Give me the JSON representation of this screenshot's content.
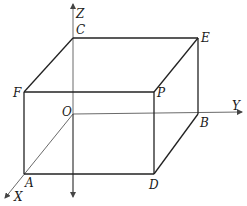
{
  "diagram": {
    "type": "3d-rectangular-box-with-axes",
    "axes": {
      "z_label": "Z",
      "y_label": "Y",
      "x_label": "X",
      "origin_label": "O"
    },
    "vertices": {
      "C": "C",
      "E": "E",
      "F": "F",
      "P": "P",
      "O": "O",
      "B": "B",
      "A": "A",
      "D": "D"
    },
    "edges": [
      [
        "C",
        "E"
      ],
      [
        "C",
        "F"
      ],
      [
        "E",
        "P"
      ],
      [
        "F",
        "P"
      ],
      [
        "E",
        "B"
      ],
      [
        "F",
        "A"
      ],
      [
        "P",
        "D"
      ],
      [
        "A",
        "D"
      ],
      [
        "B",
        "D"
      ]
    ],
    "hidden_axis_edges": [
      [
        "O",
        "C"
      ],
      [
        "O",
        "B"
      ],
      [
        "O",
        "A"
      ]
    ],
    "colors": {
      "edge": "#222222",
      "axis": "#444444",
      "background": "#ffffff"
    }
  }
}
